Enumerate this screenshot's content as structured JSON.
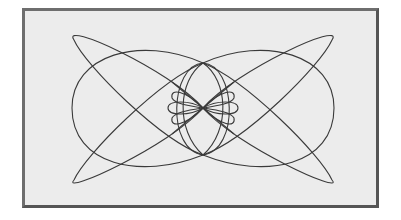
{
  "figure": {
    "type": "parametric-curve",
    "stroke_color": "#3a3a3a",
    "background_color": "#ececec",
    "frame_color": "#5e5e5e"
  },
  "shapes": {
    "outer_loops": [
      {
        "name": "left-upper-narrow-loop",
        "d": "M 203 108 C 170 70, 60 20, 74 40 C 85 65, 160 140, 203 155"
      },
      {
        "name": "left-lower-narrow-loop",
        "d": "M 203 108 C 170 146, 60 196, 74 180 C 85 155, 160 80, 203 63"
      },
      {
        "name": "right-upper-narrow-loop",
        "d": "M 203 108 C 236 70, 346 20, 332 40 C 321 65, 246 140, 203 155"
      },
      {
        "name": "right-lower-narrow-loop",
        "d": "M 203 108 C 236 146, 346 196, 332 180 C 321 155, 246 80, 203 63"
      },
      {
        "name": "left-round-loop",
        "d": "M 203 63 C 140 35, 72 55, 72 108 C 72 165, 140 180, 203 155"
      },
      {
        "name": "right-round-loop",
        "d": "M 203 63 C 266 35, 334 55, 334 108 C 334 165, 266 180, 203 155"
      }
    ],
    "center_lobes": [
      {
        "name": "center-outer-left-lobe",
        "d": "M 203 63 C 170 65, 166 150, 203 155"
      },
      {
        "name": "center-outer-right-lobe",
        "d": "M 203 63 C 236 65, 240 150, 203 155"
      },
      {
        "name": "center-mid-left-lobe",
        "d": "M 203 63 C 178 80, 175 130, 203 155"
      },
      {
        "name": "center-mid-right-lobe",
        "d": "M 203 63 C 228 80, 231 130, 203 155"
      },
      {
        "name": "center-upper-left-petal",
        "d": "M 203 108 C 185 90, 170 88, 172 98 C 175 104, 190 106, 203 108"
      },
      {
        "name": "center-upper-right-petal",
        "d": "M 203 108 C 221 90, 236 88, 234 98 C 231 104, 216 106, 203 108"
      },
      {
        "name": "center-lower-left-petal",
        "d": "M 203 108 C 185 126, 170 128, 172 118 C 175 112, 190 110, 203 108"
      },
      {
        "name": "center-lower-right-petal",
        "d": "M 203 108 C 221 126, 236 128, 234 118 C 231 112, 216 110, 203 108"
      },
      {
        "name": "center-left-mid-petal",
        "d": "M 203 108 C 190 100, 168 100, 168 108 C 168 116, 190 116, 203 108"
      },
      {
        "name": "center-right-mid-petal",
        "d": "M 203 108 C 216 100, 238 100, 238 108 C 238 116, 216 116, 203 108"
      },
      {
        "name": "center-cross-a",
        "d": "M 172 82 L 234 134"
      },
      {
        "name": "center-cross-b",
        "d": "M 234 82 L 172 134"
      }
    ]
  }
}
